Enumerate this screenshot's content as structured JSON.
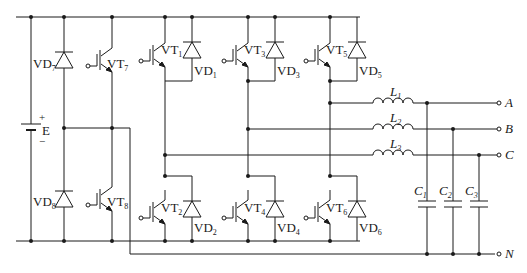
{
  "diagram": {
    "type": "circuit",
    "source": {
      "label": "E",
      "plus": "+",
      "minus": "−"
    },
    "neutral_leg": {
      "diodes": [
        {
          "name": "VD",
          "sub": "7"
        },
        {
          "name": "VD",
          "sub": "8"
        }
      ],
      "switches": [
        {
          "name": "VT",
          "sub": "7"
        },
        {
          "name": "VT",
          "sub": "8"
        }
      ]
    },
    "bridge": {
      "upper_switches": [
        {
          "name": "VT",
          "sub": "1"
        },
        {
          "name": "VT",
          "sub": "3"
        },
        {
          "name": "VT",
          "sub": "5"
        }
      ],
      "upper_diodes": [
        {
          "name": "VD",
          "sub": "1"
        },
        {
          "name": "VD",
          "sub": "3"
        },
        {
          "name": "VD",
          "sub": "5"
        }
      ],
      "lower_switches": [
        {
          "name": "VT",
          "sub": "2"
        },
        {
          "name": "VT",
          "sub": "4"
        },
        {
          "name": "VT",
          "sub": "6"
        }
      ],
      "lower_diodes": [
        {
          "name": "VD",
          "sub": "2"
        },
        {
          "name": "VD",
          "sub": "4"
        },
        {
          "name": "VD",
          "sub": "6"
        }
      ]
    },
    "filter": {
      "inductors": [
        {
          "name": "L",
          "sub": "1"
        },
        {
          "name": "L",
          "sub": "2"
        },
        {
          "name": "L",
          "sub": "3"
        }
      ],
      "capacitors": [
        {
          "name": "C",
          "sub": "1"
        },
        {
          "name": "C",
          "sub": "2"
        },
        {
          "name": "C",
          "sub": "3"
        }
      ]
    },
    "terminals": [
      "A",
      "B",
      "C",
      "N"
    ]
  }
}
